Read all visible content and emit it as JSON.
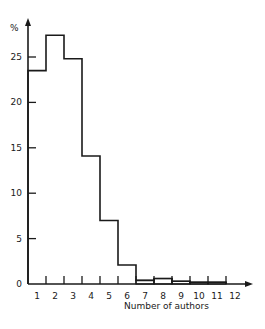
{
  "chart_data": {
    "type": "bar",
    "style": "step-histogram",
    "title": "",
    "xlabel": "Number of authors",
    "ylabel": "%",
    "categories": [
      "1",
      "2",
      "3",
      "4",
      "5",
      "6",
      "7",
      "8",
      "9",
      "10",
      "11",
      "12"
    ],
    "values": [
      23.5,
      27.4,
      24.8,
      14.1,
      7.0,
      2.1,
      0.4,
      0.6,
      0.3,
      0.2,
      0.2,
      null
    ],
    "ylim": [
      0,
      28
    ],
    "yticks": [
      0,
      5,
      10,
      15,
      20,
      25
    ],
    "ytick_labels": [
      "0",
      "5",
      "10",
      "15",
      "20",
      "25"
    ],
    "grid": false,
    "legend": null
  },
  "colors": {
    "line": "#1a1a1a",
    "background": "#ffffff"
  }
}
